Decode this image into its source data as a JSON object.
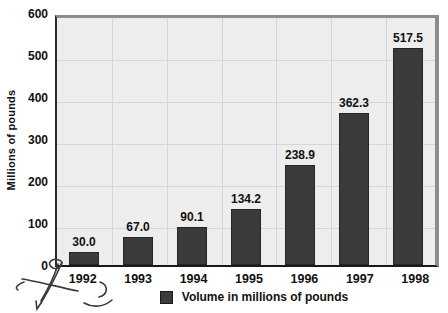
{
  "chart_data": {
    "type": "bar",
    "title": "",
    "xlabel": "",
    "ylabel": "Millions of pounds",
    "categories": [
      "1992",
      "1993",
      "1994",
      "1995",
      "1996",
      "1997",
      "1998"
    ],
    "values": [
      30.0,
      67.0,
      90.1,
      134.2,
      238.9,
      362.3,
      517.5
    ],
    "value_labels": [
      "30.0",
      "67.0",
      "90.1",
      "134.2",
      "238.9",
      "362.3",
      "517.5"
    ],
    "ylim": [
      0,
      600
    ],
    "yticks": [
      0,
      100,
      200,
      300,
      400,
      500,
      600
    ],
    "grid": true,
    "legend": [
      {
        "label": "Volume in millions of pounds",
        "color": "#3b3b3b"
      }
    ],
    "legend_position": "bottom",
    "colors": {
      "bar": "#3b3b3b",
      "plot_background": "#ededed",
      "gridline": "#d6d6d6",
      "frame_shadow": "#8c8c8c",
      "axis": "#1a1a1a",
      "text": "#111111"
    }
  }
}
